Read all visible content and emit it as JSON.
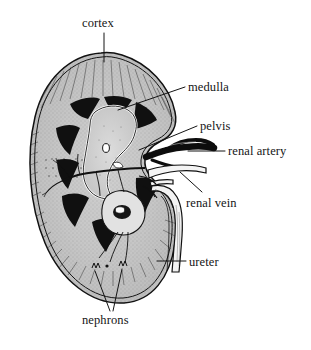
{
  "figure": {
    "kind": "anatomical-diagram",
    "background_color": "#ffffff",
    "ink_color": "#111111",
    "tissue_fill": "#c9c9c9",
    "medulla_fill": "#111111",
    "width": 311,
    "height": 350
  },
  "labels": {
    "cortex": "cortex",
    "medulla": "medulla",
    "pelvis": "pelvis",
    "renal_artery": "renal artery",
    "renal_vein": "renal vein",
    "ureter": "ureter",
    "nephrons": "nephrons"
  },
  "annotations": [
    {
      "id": "cortex",
      "text": "cortex",
      "text_x": 82,
      "text_y": 17,
      "leader": "vertical",
      "leader_from": [
        104,
        33
      ],
      "leader_to": [
        104,
        62
      ],
      "points_to": "outer-cortex-region-top"
    },
    {
      "id": "medulla",
      "text": "medulla",
      "text_x": 188,
      "text_y": 81,
      "leader": "diagonal-down-left",
      "leader_from": [
        185,
        88
      ],
      "leader_to": [
        118,
        110
      ],
      "points_to": "renal-pyramid"
    },
    {
      "id": "pelvis",
      "text": "pelvis",
      "text_x": 200,
      "text_y": 120,
      "leader": "diagonal-down-left",
      "leader_from": [
        196,
        127
      ],
      "leader_to": [
        139,
        150
      ],
      "points_to": "renal-pelvis"
    },
    {
      "id": "renal_artery",
      "text": "renal artery",
      "text_x": 228,
      "text_y": 145,
      "leader": "horizontal",
      "leader_from": [
        225,
        151
      ],
      "leader_to": [
        190,
        151
      ],
      "points_to": "renal-artery-trunk"
    },
    {
      "id": "renal_vein",
      "text": "renal vein",
      "text_x": 186,
      "text_y": 197,
      "leader": "diagonal-up-left",
      "leader_from": [
        198,
        192
      ],
      "leader_to": [
        178,
        173
      ],
      "points_to": "renal-vein-trunk"
    },
    {
      "id": "ureter",
      "text": "ureter",
      "text_x": 189,
      "text_y": 256,
      "leader": "horizontal",
      "leader_from": [
        186,
        261
      ],
      "leader_to": [
        158,
        261
      ],
      "points_to": "ureter-tube"
    },
    {
      "id": "nephrons",
      "text": "nephrons",
      "text_x": 82,
      "text_y": 314,
      "leader": "v-shaped-two-lines",
      "leader_from": [
        110,
        312
      ],
      "leader_to_a": [
        95,
        272
      ],
      "leader_to_b": [
        122,
        270
      ],
      "points_to": "nephron-tufts"
    }
  ],
  "structures": [
    {
      "name": "renal-capsule",
      "description": "double outline bean-shaped kidney border"
    },
    {
      "name": "cortex",
      "description": "outer stippled band with fine radiating rays"
    },
    {
      "name": "medulla",
      "description": "dark wedge-shaped renal pyramids"
    },
    {
      "name": "renal-pelvis",
      "description": "pale central funnel-shaped cavity"
    },
    {
      "name": "renal-artery",
      "description": "thick black vessel entering the hilum from the right"
    },
    {
      "name": "renal-vein",
      "description": "outlined vessel leaving the hilum, below the artery"
    },
    {
      "name": "ureter",
      "description": "long tube descending from the pelvis to the lower right"
    },
    {
      "name": "nephrons",
      "description": "small tufted structures at the lower cortex"
    }
  ]
}
